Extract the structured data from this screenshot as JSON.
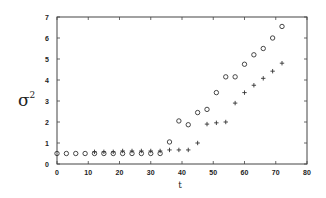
{
  "chart_data": {
    "type": "scatter",
    "title": "",
    "xlabel": "t",
    "ylabel": "σ²",
    "xlim": [
      0,
      80
    ],
    "ylim": [
      0,
      7
    ],
    "xticks": [
      0,
      10,
      20,
      30,
      40,
      50,
      60,
      70,
      80
    ],
    "yticks": [
      0,
      1,
      2,
      3,
      4,
      5,
      6,
      7
    ],
    "grid": false,
    "legend": null,
    "series": [
      {
        "name": "circles",
        "marker": "o",
        "points": [
          [
            0,
            0.5
          ],
          [
            3,
            0.5
          ],
          [
            6,
            0.5
          ],
          [
            9,
            0.5
          ],
          [
            12,
            0.5
          ],
          [
            15,
            0.5
          ],
          [
            18,
            0.5
          ],
          [
            21,
            0.5
          ],
          [
            24,
            0.5
          ],
          [
            27,
            0.5
          ],
          [
            30,
            0.5
          ],
          [
            33,
            0.5
          ],
          [
            36,
            1.05
          ],
          [
            39,
            2.05
          ],
          [
            42,
            1.87
          ],
          [
            45,
            2.45
          ],
          [
            48,
            2.6
          ],
          [
            51,
            3.4
          ],
          [
            54,
            4.15
          ],
          [
            57,
            4.15
          ],
          [
            60,
            4.75
          ],
          [
            63,
            5.2
          ],
          [
            66,
            5.5
          ],
          [
            69,
            6.0
          ],
          [
            72,
            6.55
          ]
        ]
      },
      {
        "name": "plus",
        "marker": "+",
        "points": [
          [
            12,
            0.58
          ],
          [
            15,
            0.58
          ],
          [
            18,
            0.58
          ],
          [
            21,
            0.62
          ],
          [
            24,
            0.62
          ],
          [
            27,
            0.62
          ],
          [
            30,
            0.62
          ],
          [
            33,
            0.62
          ],
          [
            36,
            0.67
          ],
          [
            39,
            0.67
          ],
          [
            42,
            0.67
          ],
          [
            45,
            1.0
          ],
          [
            48,
            1.9
          ],
          [
            51,
            1.96
          ],
          [
            54,
            2.0
          ],
          [
            57,
            2.9
          ],
          [
            60,
            3.4
          ],
          [
            63,
            3.75
          ],
          [
            66,
            4.08
          ],
          [
            69,
            4.42
          ],
          [
            72,
            4.8
          ]
        ]
      }
    ]
  },
  "axes": {
    "x_label": "t",
    "y_label": "σ",
    "y_label_sup": "2"
  }
}
